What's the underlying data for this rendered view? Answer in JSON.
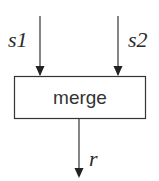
{
  "diagram": {
    "type": "block-diagram",
    "colors": {
      "stroke": "#333333",
      "text": "#2a2a2a",
      "background": "#ffffff"
    },
    "nodes": [
      {
        "id": "merge",
        "label": "merge",
        "shape": "rectangle"
      }
    ],
    "inputs": [
      {
        "id": "s1",
        "label": "s1",
        "target": "merge"
      },
      {
        "id": "s2",
        "label": "s2",
        "target": "merge"
      }
    ],
    "outputs": [
      {
        "id": "r",
        "label": "r",
        "source": "merge"
      }
    ]
  }
}
